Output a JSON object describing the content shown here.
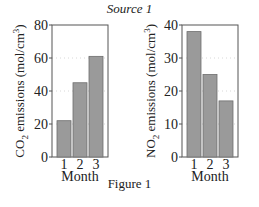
{
  "header": {
    "source": "Source 1"
  },
  "footer": {
    "caption": "Figure 1"
  },
  "colors": {
    "bar": "#9a9a9a",
    "bar_edge": "#6e6e6e",
    "axis": "#555555",
    "grid": "#d8d8d8"
  },
  "chart_data": [
    {
      "type": "bar",
      "title": "",
      "categories": [
        "1",
        "2",
        "3"
      ],
      "values": [
        22,
        45,
        61
      ],
      "xlabel": "Month",
      "ylabel": "CO2 emissions (mol/cm3)",
      "ylabel_parts": {
        "pre": "CO",
        "sub": "2",
        "mid": " emissions (mol/cm",
        "sup": "3",
        "post": ")"
      },
      "ylim": [
        0,
        80
      ],
      "yticks": [
        0,
        20,
        40,
        60,
        80
      ],
      "grid": true,
      "legend": null
    },
    {
      "type": "bar",
      "title": "",
      "categories": [
        "1",
        "2",
        "3"
      ],
      "values": [
        38,
        25,
        17
      ],
      "xlabel": "Month",
      "ylabel": "NO2 emissions (mol/cm3)",
      "ylabel_parts": {
        "pre": "NO",
        "sub": "2",
        "mid": " emissions (mol/cm",
        "sup": "3",
        "post": ")"
      },
      "ylim": [
        0,
        40
      ],
      "yticks": [
        0,
        10,
        20,
        30,
        40
      ],
      "grid": true,
      "legend": null
    }
  ]
}
